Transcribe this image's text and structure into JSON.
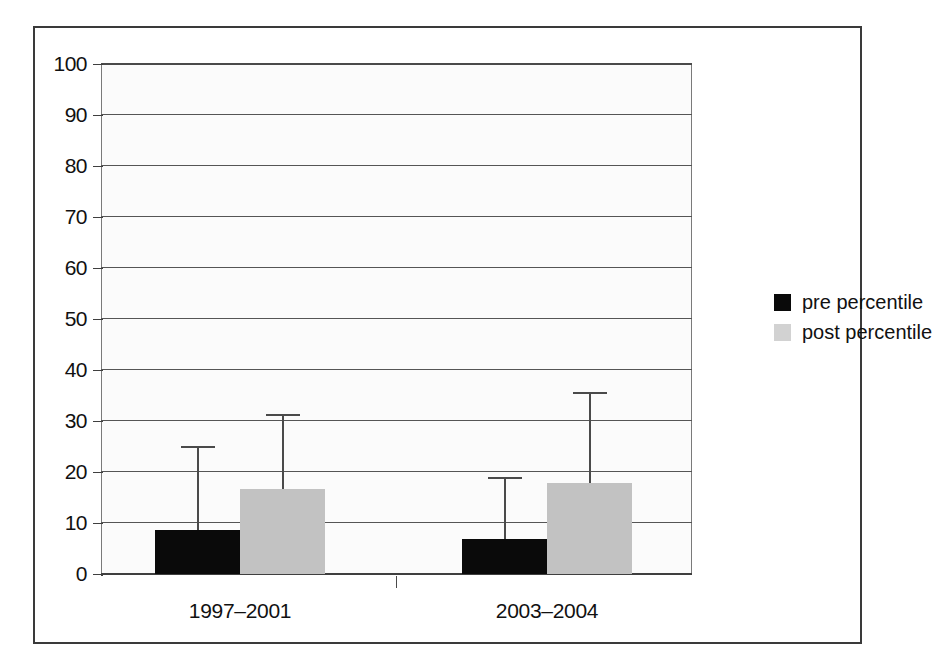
{
  "figure": {
    "background_color": "#ffffff",
    "frame_color": "#3a3a3a"
  },
  "chart_data": {
    "type": "bar",
    "title": "",
    "subtitle": "",
    "xlabel": "",
    "ylabel": "",
    "categories": [
      "1997–2001",
      "2003–2004"
    ],
    "ylim": [
      0,
      100
    ],
    "yticks": [
      0,
      10,
      20,
      30,
      40,
      50,
      60,
      70,
      80,
      90,
      100
    ],
    "ytick_labels": [
      "0",
      "10",
      "20",
      "30",
      "40",
      "50",
      "60",
      "70",
      "80",
      "90",
      "100"
    ],
    "grid": true,
    "grid_axis": "y",
    "legend_position": "right",
    "error_bars": "upper-only",
    "series": [
      {
        "name": "pre percentile",
        "color": "#0a0a0a",
        "values": [
          8.6,
          6.8
        ],
        "error_upper": [
          25.1,
          19.0
        ]
      },
      {
        "name": "post percentile",
        "color": "#c2c2c2",
        "values": [
          16.7,
          17.8
        ],
        "error_upper": [
          31.4,
          35.7
        ]
      }
    ]
  },
  "legend": {
    "items": [
      {
        "label": "pre percentile",
        "swatch": "legend-swatch-pre"
      },
      {
        "label": "post percentile",
        "swatch": "legend-swatch-post"
      }
    ]
  }
}
